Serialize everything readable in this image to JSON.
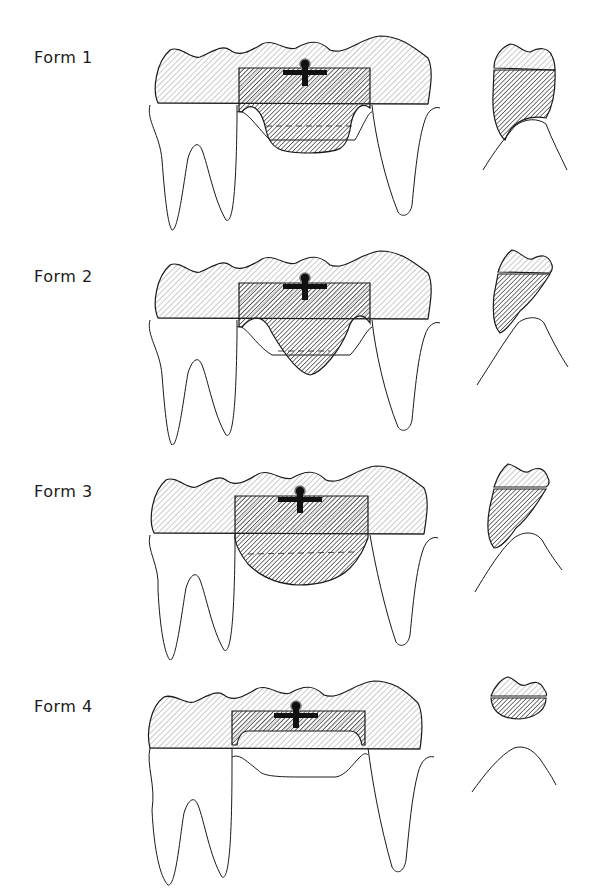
{
  "figure": {
    "colors": {
      "outline": "#1a1a1a",
      "crown_hatch": "#9a9a9a",
      "pontic_hatch": "#3c3c3c",
      "connector": "#111111",
      "background": "#ffffff"
    },
    "forms": [
      {
        "label": "Form 1",
        "pontic_shape": "saddle-ridge-lap",
        "ridge_contact": "broad saddle covering ridge"
      },
      {
        "label": "Form 2",
        "pontic_shape": "ridge-lap",
        "ridge_contact": "V-shaped ridge lap"
      },
      {
        "label": "Form 3",
        "pontic_shape": "modified-ridge-lap",
        "ridge_contact": "rounded, buccal contact only"
      },
      {
        "label": "Form 4",
        "pontic_shape": "sanitary-hygienic",
        "ridge_contact": "no ridge contact"
      }
    ]
  }
}
